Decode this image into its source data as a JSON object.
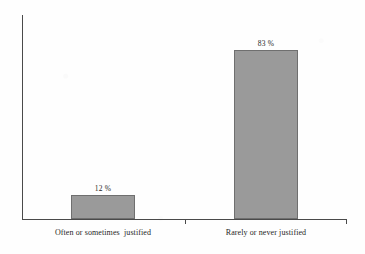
{
  "chart_data": {
    "type": "bar",
    "title": "",
    "subtitle": "",
    "xlabel": "",
    "ylabel": "",
    "categories": [
      "Often or sometimes  justified",
      "Rarely or never justified"
    ],
    "values": [
      12,
      83
    ],
    "value_labels": [
      "12 %",
      "83 %"
    ],
    "unit": "%",
    "ylim": [
      0,
      98
    ],
    "grid": false,
    "legend": null,
    "series": [
      {
        "name": "",
        "values": [
          12,
          83
        ]
      }
    ],
    "colors": {
      "bar_fill": "#9a9a9a",
      "bar_stroke": "#6f6f6f",
      "axis": "#4a4a4a",
      "text": "#1f1f1f",
      "background": "#fefefe"
    },
    "axis": {
      "y_axis_visible": true,
      "y_ticks": [],
      "y_tick_labels": [],
      "x_axis_visible": true,
      "x_tick_marks": 2
    }
  }
}
